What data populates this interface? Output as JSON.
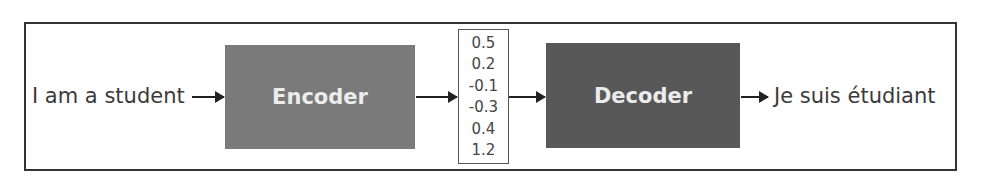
{
  "diagram": {
    "input_text": "I am a student",
    "encoder": {
      "label": "Encoder",
      "color": "#7a7a7a"
    },
    "vector": {
      "values": [
        "0.5",
        "0.2",
        "-0.1",
        "-0.3",
        "0.4",
        "1.2"
      ]
    },
    "decoder": {
      "label": "Decoder",
      "color": "#585858"
    },
    "output_text": "Je suis étudiant"
  }
}
